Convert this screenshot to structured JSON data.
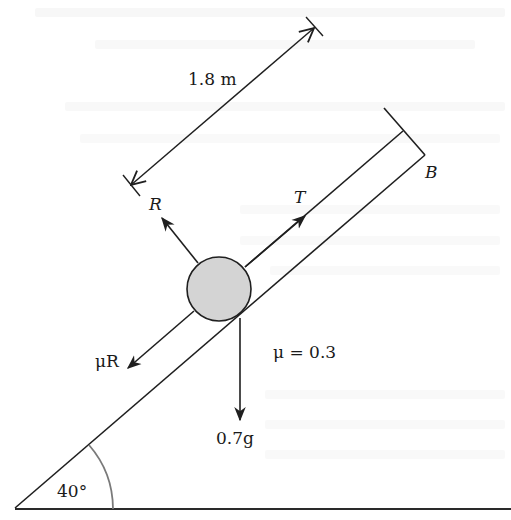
{
  "diagram": {
    "type": "inclined-plane-free-body",
    "labels": {
      "length": "1.8 m",
      "normal_reaction": "R",
      "tension": "T",
      "friction": "μR",
      "coefficient": "μ = 0.3",
      "weight": "0.7g",
      "angle": "40°",
      "point": "B"
    },
    "colors": {
      "line": "#1f1f1f",
      "ball_fill": "#d4d4d4",
      "angle_arc": "#7a7a7a"
    }
  }
}
